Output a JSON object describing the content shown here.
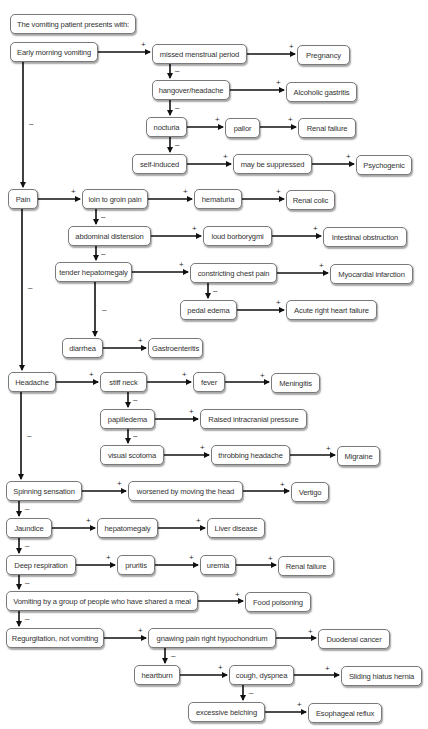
{
  "diagram": {
    "title": "The vomiting patient presents with:",
    "nodes": {
      "early_morning_vomiting": "Early morning vomiting",
      "missed_menstrual_period": "missed menstrual period",
      "pregnancy": "Pregnancy",
      "hangover_headache": "hangover/headache",
      "alcoholic_gastritis": "Alcoholic gastritis",
      "nocturia": "nocturia",
      "pallor": "pallor",
      "renal_failure_1": "Renal failure",
      "self_induced": "self-induced",
      "may_be_suppressed": "may be suppressed",
      "psychogenic": "Psychogenic",
      "pain": "Pain",
      "loin_to_groin_pain": "loin to groin pain",
      "hematuria": "hematuria",
      "renal_colic": "Renal colic",
      "abdominal_distension": "abdominal distension",
      "loud_borborygmi": "loud borborygmi",
      "intestinal_obstruction": "Intestinal obstruction",
      "tender_hepatomegaly": "tender hepatomegaly",
      "constricting_chest_pain": "constricting chest pain",
      "myocardial_infarction": "Myocardial infarction",
      "pedal_edema": "pedal edema",
      "acute_right_heart_failure": "Acute right heart failure",
      "diarrhea": "diarrhea",
      "gastroenteritis": "Gastroenteritis",
      "headache": "Headache",
      "stiff_neck": "stiff neck",
      "fever": "fever",
      "meningitis": "Meningitis",
      "papilledema": "papilledema",
      "raised_intracranial_pressure": "Raised intracranial pressure",
      "visual_scotoma": "visual scotoma",
      "throbbing_headache": "throbbing headache",
      "migraine": "Migraine",
      "spinning_sensation": "Spinning sensation",
      "worsened_by_moving_head": "worsened by moving the head",
      "vertigo": "Vertigo",
      "jaundice": "Jaundice",
      "hepatomegaly": "hepatomegaly",
      "liver_disease": "Liver disease",
      "deep_respiration": "Deep respiration",
      "pruritis": "pruritis",
      "uremia": "uremia",
      "renal_failure_2": "Renal failure",
      "group_vomiting": "Vomiting by a group of people who have shared a meal",
      "food_poisoning": "Food poisoning",
      "regurgitation": "Regurgitation, not vomiting",
      "gnawing_pain": "gnawing pain right hypochondrium",
      "duodenal_cancer": "Duodenal cancer",
      "heartburn": "heartburn",
      "cough_dyspnea": "cough, dyspnea",
      "sliding_hiatus_hernia": "Sliding hiatus hernia",
      "excessive_belching": "excessive belching",
      "esophageal_reflux": "Esophageal reflux"
    },
    "signs": {
      "yes": "+",
      "no": "–"
    },
    "colors": {
      "line": "#111111",
      "border": "#7a7a7a",
      "text": "#333333",
      "background": "#ffffff"
    }
  }
}
